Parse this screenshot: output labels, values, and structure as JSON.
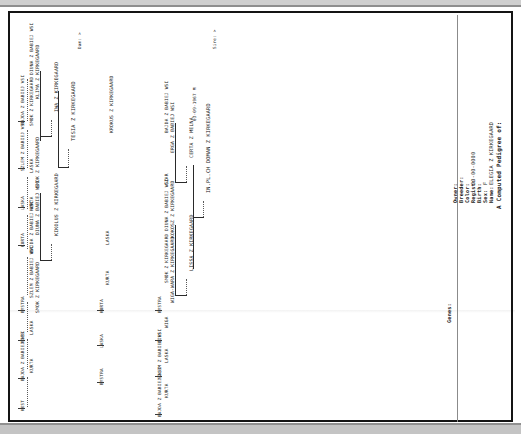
{
  "document": {
    "kind": "pedigree-chart",
    "orientation": "rotated-90-landscape"
  },
  "header": {
    "title": "A Computed Pedigree of:",
    "fields": [
      {
        "label": "Name:",
        "value": "ELEGIA Z KIRKEGAARD"
      },
      {
        "label": "Sex:",
        "value": "F"
      },
      {
        "label": "Birth:",
        "value": ""
      },
      {
        "label": "Regist:",
        "value": "00-00-0000"
      },
      {
        "label": "Color:",
        "value": ""
      },
      {
        "label": "Breeder:",
        "value": ""
      },
      {
        "label": "Owner:",
        "value": ""
      }
    ],
    "genes_label": "Genes:"
  },
  "dam_block": {
    "role_label": "Dam: >",
    "name": "TESIA Z KIRKEGAARD"
  },
  "sire_block": {
    "role_label": "Sire: >",
    "name": "IN.PL.CH DOMAN Z KIRKEGAARD",
    "detail": "03-09-1967 M"
  },
  "generations": {
    "gen2": [
      {
        "name": "IWA Z KIRKEGAARD"
      },
      {
        "name": "KIKOLUS Z KIRKEGAARD"
      },
      {
        "name": "CERTA Z MELNA"
      },
      {
        "name": "LISSA Z KIRKEGAARD"
      }
    ],
    "gen3": [
      {
        "name": "KLIMA Z KIRKEGAARD"
      },
      {
        "name": "SMOK Z KIRKEGAARD"
      },
      {
        "name": "DIUNA Z BABIEJ WSI"
      },
      {
        "name": "SMOK Z KIRKEGAARD"
      },
      {
        "name": "ERGA Z BABIEJ WSI"
      },
      {
        "name": "KOKOSZ Z KIRKEGAARD"
      },
      {
        "name": "WIGA-WARA Z KIRKEGAARD"
      },
      {
        "name": "KROKUS Z KIRKEGAARD"
      }
    ],
    "gen4": [
      {
        "name": "DIUNA Z BABIEJ WSI"
      },
      {
        "name": "SMOK Z KIRKEGAARD"
      },
      {
        "name": "LASKA"
      },
      {
        "name": "KURTA"
      },
      {
        "name": "BAJDA Z BABIEJ WSI"
      },
      {
        "name": "SZLEM Z BABIEJ WSI"
      },
      {
        "name": "LASKA"
      },
      {
        "name": "KURTA"
      },
      {
        "name": "BAJDA Z BABIEJ WSI"
      },
      {
        "name": "CZAR"
      },
      {
        "name": "DIUNA Z BABIEJ WSI"
      },
      {
        "name": "SMOK Z KIRKEGAARD"
      },
      {
        "name": "WIGA"
      },
      {
        "name": "LASKA"
      },
      {
        "name": "KURTA"
      },
      {
        "name": "LASKA"
      },
      {
        "name": "KURTA"
      }
    ],
    "gen5": [
      {
        "name": "BAJDA Z BABIEJ WSI"
      },
      {
        "name": "SZLEM Z BABIEJ WSI"
      },
      {
        "name": "LASKA"
      },
      {
        "name": "KURTA"
      },
      {
        "name": "BYSTRA"
      },
      {
        "name": "BIES"
      },
      {
        "name": "BAJDA Z BABIEJ WSI"
      },
      {
        "name": "KOST"
      },
      {
        "name": "BYSTRA"
      },
      {
        "name": "BIES"
      },
      {
        "name": "SZLEM Z BABIEJ WSI"
      },
      {
        "name": "BAJDA Z BABIEJ WSI"
      },
      {
        "name": "KURTA"
      },
      {
        "name": "LASKA"
      },
      {
        "name": "BYSTRA"
      }
    ]
  }
}
